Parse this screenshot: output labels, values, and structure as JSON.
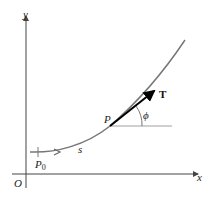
{
  "diagram": {
    "axes": {
      "x_label": "x",
      "y_label": "y",
      "origin_label": "O"
    },
    "points": {
      "start_label": "P",
      "start_subscript": "0",
      "point_label": "P"
    },
    "arc_length_label": "s",
    "tangent_label": "T",
    "angle_label": "ϕ",
    "colors": {
      "curve": "#777777",
      "axis": "#444444",
      "tangent": "#000000"
    }
  }
}
